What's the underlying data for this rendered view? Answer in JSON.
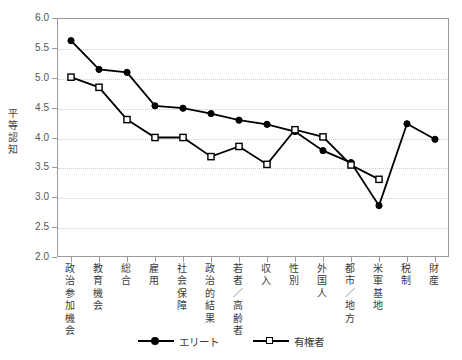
{
  "chart_data": {
    "type": "line",
    "title": "",
    "xlabel": "",
    "ylabel": "平等認知",
    "ylim": [
      2.0,
      6.0
    ],
    "ytick_step": 0.5,
    "grid": true,
    "legend_position": "bottom-center",
    "categories": [
      "政治参加機会",
      "教育機会",
      "総合",
      "雇用",
      "社会保障",
      "政治的結果",
      "若者／高齢者",
      "収入",
      "性別",
      "外国人",
      "都市／地方",
      "米軍基地",
      "税制",
      "財産"
    ],
    "yticks": [
      "2.0",
      "2.5",
      "3.0",
      "3.5",
      "4.0",
      "4.5",
      "5.0",
      "5.5",
      "6.0"
    ],
    "series": [
      {
        "name": "エリート",
        "marker": "filled-circle",
        "color": "#000000",
        "values": [
          5.62,
          5.14,
          5.09,
          4.53,
          4.49,
          4.4,
          4.29,
          4.22,
          4.1,
          3.78,
          3.58,
          2.86,
          4.23,
          3.97
        ]
      },
      {
        "name": "有権者",
        "marker": "open-square",
        "color": "#000000",
        "values": [
          5.01,
          4.84,
          4.3,
          4.0,
          4.0,
          3.68,
          3.85,
          3.55,
          4.13,
          4.01,
          3.54,
          3.3,
          null,
          null
        ]
      }
    ]
  },
  "legend": {
    "items": [
      {
        "label": "エリート",
        "marker": "filled-circle"
      },
      {
        "label": "有権者",
        "marker": "open-square"
      }
    ]
  },
  "colors": {
    "axis": "#9a9a9a",
    "grid": "#cfcfcf",
    "text": "#3a3a3a",
    "series": "#000000",
    "background": "#ffffff"
  }
}
